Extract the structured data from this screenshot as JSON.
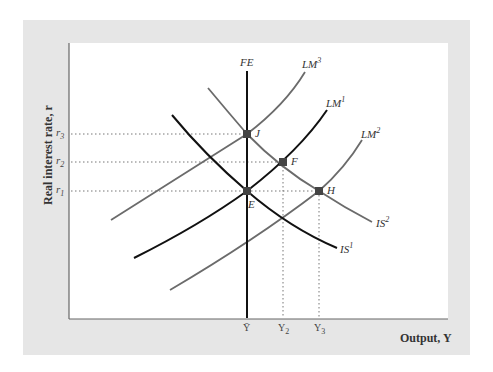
{
  "figure": {
    "y_axis_label": "Real interest rate, r",
    "x_axis_label": "Output, Y",
    "y_ticks": [
      {
        "base": "r",
        "sub": "3"
      },
      {
        "base": "r",
        "sub": "2"
      },
      {
        "base": "r",
        "sub": "1"
      }
    ],
    "x_ticks": [
      {
        "base": "Ȳ",
        "sub": ""
      },
      {
        "base": "Y",
        "sub": "2"
      },
      {
        "base": "Y",
        "sub": "3"
      }
    ],
    "curves": {
      "FE": {
        "base": "FE",
        "sup": ""
      },
      "LM3": {
        "base": "LM",
        "sup": "3"
      },
      "LM1": {
        "base": "LM",
        "sup": "1"
      },
      "LM2": {
        "base": "LM",
        "sup": "2"
      },
      "IS1": {
        "base": "IS",
        "sup": "1"
      },
      "IS2": {
        "base": "IS",
        "sup": "2"
      }
    },
    "points": {
      "J": "J",
      "F": "F",
      "E": "E",
      "H": "H"
    },
    "colors": {
      "panel": "#e6e6e6",
      "dark_curve": "#111111",
      "gray_curve": "#6b6b6b",
      "point": "#444444"
    }
  }
}
